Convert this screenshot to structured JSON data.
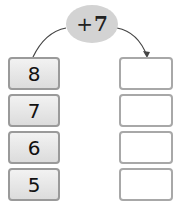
{
  "operator": {
    "sign": "+",
    "value": "7",
    "fill": "#d3d3d3"
  },
  "inputs": [
    "8",
    "7",
    "6",
    "5"
  ],
  "outputs": [
    "",
    "",
    "",
    ""
  ]
}
